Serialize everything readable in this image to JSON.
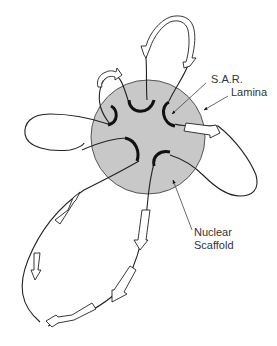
{
  "diagram": {
    "labels": {
      "sar": "S.A.R.",
      "lamina": "Lamina",
      "scaffold_line1": "Nuclear",
      "scaffold_line2": "Scaffold"
    },
    "components": [
      {
        "id": "nuclear-scaffold",
        "shape": "circle",
        "fill": "#c8c8c8",
        "center": [
          148,
          137
        ],
        "radius": 57
      },
      {
        "id": "sar-attachment-sites",
        "count": 6,
        "shape": "black arc",
        "color": "#111111"
      },
      {
        "id": "dna-loops",
        "count": 5,
        "color": "#222222"
      },
      {
        "id": "gene-arrows",
        "shape": "hollow block arrow",
        "fill": "#ffffff",
        "stroke": "#222222"
      }
    ],
    "colors": {
      "scaffold_fill": "#c8c8c8",
      "scaffold_stroke": "#555555",
      "sar_arc": "#111111",
      "loop_stroke": "#222222",
      "leader_line": "#444444",
      "text": "#333333"
    }
  }
}
